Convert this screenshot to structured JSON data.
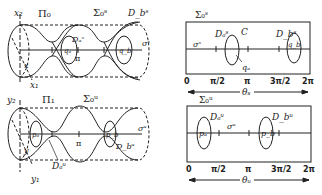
{
  "figure": {
    "top_left": {
      "plane_label": "Π₀",
      "surface_label": "Σ₀ˢ",
      "axis_labels": {
        "vertical": "x₂",
        "diagonal": "x₁",
        "point": "x"
      },
      "disk_a": "Dₐˢ",
      "disk_b": "D_bˢ",
      "point_a": "qₐ",
      "point_b": "q_b",
      "pi_label": "π",
      "orbit_label": "σˢ"
    },
    "bottom_left": {
      "plane_label": "Π₁",
      "surface_label": "Σ₀ᵘ",
      "axis_labels": {
        "vertical": "y₂",
        "diagonal": "y₁",
        "point": "y"
      },
      "disk_a": "Dₐᵘ",
      "disk_b": "D_bᵘ",
      "point_a": "pₐ",
      "point_b": "p_b",
      "pi_label": "π",
      "orbit_label": "σᵘ"
    },
    "top_right": {
      "surface_label": "Σ₀ˢ",
      "disk_a": "Dₐˢ",
      "curve_label": "C",
      "disk_b": "D_bˢ",
      "point_a": "qₐ",
      "point_b": "q_b",
      "orbit_label": "σˢ",
      "ticks": [
        "0",
        "π/2",
        "π",
        "3π/2",
        "2π"
      ],
      "angle_label": "θₛ"
    },
    "bottom_right": {
      "surface_label": "Σ₀ᵘ",
      "disk_a": "Dₐᵘ",
      "disk_b": "D_bᵘ",
      "point_a": "pₐ",
      "point_b": "p_b",
      "orbit_label": "σᵘ",
      "ticks": [
        "0",
        "π/2",
        "π",
        "3π/2",
        "2π"
      ],
      "angle_label": "θᵤ"
    }
  }
}
